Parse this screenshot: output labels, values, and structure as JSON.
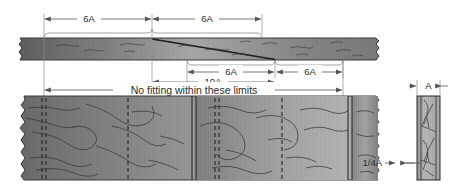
{
  "drawing": {
    "title": "Scarf joint fitting limits",
    "note_label": "No fitting within these limits",
    "dimensions": {
      "top_left_6a": "6A",
      "top_right_6a": "6A",
      "mid_left_6a": "6A",
      "mid_right_6a": "6A",
      "span_10a": "10A",
      "thickness_a": "A",
      "quarter_a": "1/4A"
    }
  },
  "colors": {
    "line": "#2b2b2b",
    "dim_line": "#555555",
    "wood_dark": "#6e6e6e",
    "wood_mid": "#8f8f8f",
    "wood_light": "#bdbdbd",
    "wood_outline": "#3a3a3a",
    "grain": "#3c3c3c",
    "background": "#ffffff"
  }
}
